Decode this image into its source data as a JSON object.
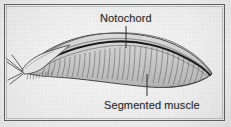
{
  "figure": {
    "background_color": "#e6e6e6",
    "frame_color": "#5e5e5e",
    "ink_color": "#3a3a3a",
    "label_text_color": "#2b2b2b",
    "labels": [
      {
        "id": "notochord",
        "text": "Notochord",
        "icon": "text-label",
        "leader_line": "vertical-down"
      },
      {
        "id": "segmented-muscle",
        "text": "Segmented muscle",
        "icon": "text-label",
        "leader_line": "vertical-up"
      }
    ],
    "parts": [
      {
        "id": "body-outline",
        "icon": "lancelet-body-outline"
      },
      {
        "id": "notochord-rod",
        "icon": "notochord-rod"
      },
      {
        "id": "myomere-hatching",
        "icon": "segmented-muscle-hatching"
      },
      {
        "id": "dorsal-fin",
        "icon": "dorsal-fin"
      },
      {
        "id": "caudal-fin",
        "icon": "caudal-fin"
      },
      {
        "id": "oral-cirri",
        "icon": "oral-cirri-bristles"
      }
    ]
  }
}
